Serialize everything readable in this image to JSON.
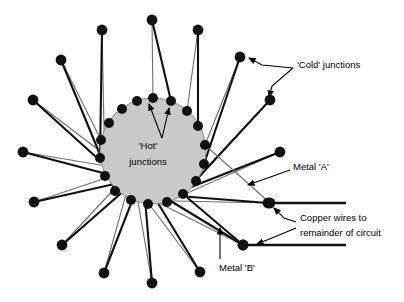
{
  "figure": {
    "type": "thermopile-schematic",
    "width": 404,
    "height": 302,
    "background": "#ffffff"
  },
  "colors": {
    "hub_fill": "#c9c9c9",
    "hub_stroke": "#8a8a8a",
    "metal_a": "#6f6f6f",
    "metal_b": "#111111",
    "dot": "#111111",
    "copper": "#111111",
    "text": "#000000"
  },
  "hub": {
    "cx": 153,
    "cy": 151,
    "r": 53,
    "label_line1": "'Hot'",
    "label_line2": "junctions",
    "label_x": 148,
    "label_y1": 146,
    "label_y2": 162
  },
  "labels": {
    "cold_junctions": {
      "text": "'Cold' junctions",
      "x": 297,
      "y": 65
    },
    "metal_a": {
      "text": "Metal 'A'",
      "x": 293,
      "y": 167
    },
    "metal_b": {
      "text": "Metal 'B'",
      "x": 219,
      "y": 268
    },
    "copper_wires_line1": {
      "text": "Copper wires to",
      "x": 300,
      "y": 218
    },
    "copper_wires_line2": {
      "text": "remainder of circuit",
      "x": 300,
      "y": 233
    }
  },
  "junctions": {
    "inner_dot_radius": 5.0,
    "outer_dot_radius": 5.4,
    "count": 18,
    "inner": [
      {
        "x": 153,
        "y": 98
      },
      {
        "x": 171,
        "y": 101
      },
      {
        "x": 187,
        "y": 111
      },
      {
        "x": 198,
        "y": 126
      },
      {
        "x": 205,
        "y": 145
      },
      {
        "x": 204,
        "y": 164
      },
      {
        "x": 196,
        "y": 181
      },
      {
        "x": 183,
        "y": 194
      },
      {
        "x": 167,
        "y": 202
      },
      {
        "x": 148,
        "y": 204
      },
      {
        "x": 131,
        "y": 200
      },
      {
        "x": 115,
        "y": 191
      },
      {
        "x": 105,
        "y": 176
      },
      {
        "x": 100,
        "y": 158
      },
      {
        "x": 101,
        "y": 140
      },
      {
        "x": 109,
        "y": 123
      },
      {
        "x": 122,
        "y": 109
      },
      {
        "x": 137,
        "y": 101
      }
    ],
    "outer": [
      {
        "x": 152,
        "y": 20
      },
      {
        "x": 198,
        "y": 30
      },
      {
        "x": 240,
        "y": 57
      },
      {
        "x": 270,
        "y": 100
      },
      {
        "x": 280,
        "y": 152
      },
      {
        "x": 268,
        "y": 203
      },
      {
        "x": 243,
        "y": 245
      },
      {
        "x": 200,
        "y": 272
      },
      {
        "x": 152,
        "y": 283
      },
      {
        "x": 104,
        "y": 273
      },
      {
        "x": 62,
        "y": 245
      },
      {
        "x": 34,
        "y": 202
      },
      {
        "x": 23,
        "y": 152
      },
      {
        "x": 33,
        "y": 100
      },
      {
        "x": 61,
        "y": 60
      },
      {
        "x": 102,
        "y": 30
      }
    ]
  },
  "copper_wires": [
    {
      "name": "upper-copper-wire",
      "x1": 270,
      "y1": 203,
      "x2": 346,
      "y2": 203
    },
    {
      "name": "lower-copper-wire",
      "x1": 243,
      "y1": 245,
      "x2": 346,
      "y2": 245
    }
  ],
  "leaders": {
    "cold_upper": {
      "path": "M 293,68 L 262,65 L 249,58"
    },
    "cold_lower": {
      "path": "M 293,68 L 272,86 L 269,97"
    },
    "metal_a": {
      "path": "M 290,170 L 248,185"
    },
    "metal_b": {
      "path": "M 220,259 L 220,228"
    },
    "copper_upper": {
      "path": "M 296,222 L 284,218 L 274,208"
    },
    "copper_lower": {
      "path": "M 296,228 L 272,238 L 257,244"
    }
  }
}
